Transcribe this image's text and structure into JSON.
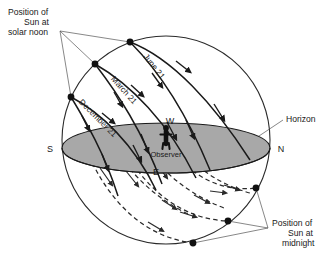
{
  "figure": {
    "width": 331,
    "height": 268,
    "background_color": "#ffffff"
  },
  "colors": {
    "stroke": "#1a1a1a",
    "horizon_fill": "#a8a8a8",
    "horizon_stroke": "#1a1a1a",
    "leader_line": "#555555",
    "text": "#1a1a1a",
    "sphere_stroke": "#2a2a2a",
    "dashed_path": "#2a2a2a"
  },
  "callouts": {
    "solar_noon": {
      "lines": [
        "Position of",
        "Sun at",
        "solar noon"
      ],
      "line1": "Position of",
      "line2": "Sun at",
      "line3": "solar noon"
    },
    "midnight": {
      "lines": [
        "Position of",
        "Sun at",
        "midnight"
      ],
      "line1": "Position of",
      "line2": "Sun at",
      "line3": "midnight"
    },
    "horizon": {
      "label": "Horizon"
    }
  },
  "cardinal_points": {
    "south": "S",
    "north": "N",
    "west": "W",
    "east": "E"
  },
  "observer": {
    "label": "Observer"
  },
  "sun_paths": [
    {
      "id": "june-21",
      "label": "June 21",
      "season": "summer solstice",
      "noon_altitude_rank": 1,
      "description": "Highest daily path; longest time above horizon"
    },
    {
      "id": "march-21",
      "label": "March 21",
      "season": "equinox",
      "noon_altitude_rank": 2,
      "description": "Middle daily path; equal day and night"
    },
    {
      "id": "december-21",
      "label": "December 21",
      "season": "winter solstice",
      "noon_altitude_rank": 3,
      "description": "Lowest daily path; shortest time above horizon"
    }
  ],
  "legend_notes": {
    "solid_arcs": "Portion of Sun path above the horizon (daytime)",
    "dashed_arcs": "Portion of Sun path below the horizon (nighttime)"
  }
}
